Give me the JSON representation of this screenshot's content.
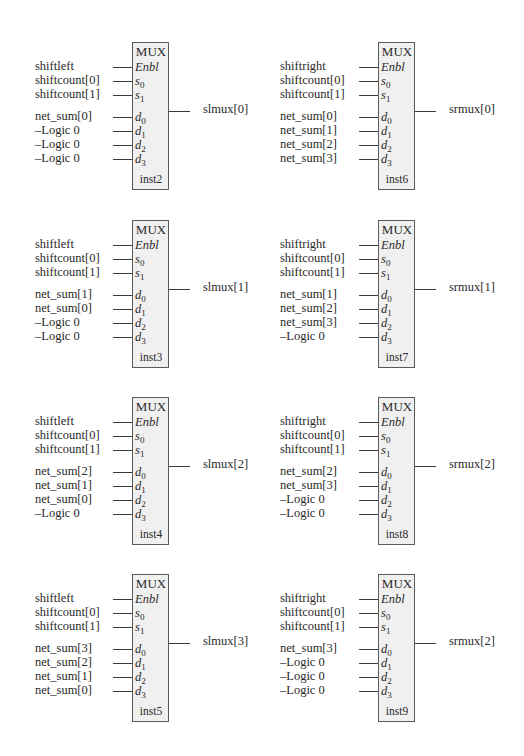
{
  "mux_title": "MUX",
  "pins": {
    "enable": "Enbl",
    "s": "s",
    "d": "d",
    "sel_subs": [
      "0",
      "1"
    ],
    "data_subs": [
      "0",
      "1",
      "2",
      "3"
    ]
  },
  "colors": {
    "box_fill": "#f0f0f0",
    "box_border": "#5a5a5a",
    "wire": "#3a3a3a",
    "text": "#2a2a2a"
  },
  "blocks": [
    {
      "instance": "inst2",
      "enable": "shiftleft",
      "sel": [
        "shiftcount[0]",
        "shiftcount[1]"
      ],
      "data": [
        "net_sum[0]",
        "–Logic 0",
        "–Logic 0",
        "–Logic 0"
      ],
      "output": "slmux[0]"
    },
    {
      "instance": "inst6",
      "enable": "shiftright",
      "sel": [
        "shiftcount[0]",
        "shiftcount[1]"
      ],
      "data": [
        "net_sum[0]",
        "net_sum[1]",
        "net_sum[2]",
        "net_sum[3]"
      ],
      "output": "srmux[0]"
    },
    {
      "instance": "inst3",
      "enable": "shiftleft",
      "sel": [
        "shiftcount[0]",
        "shiftcount[1]"
      ],
      "data": [
        "net_sum[1]",
        "net_sum[0]",
        "–Logic 0",
        "–Logic 0"
      ],
      "output": "slmux[1]"
    },
    {
      "instance": "inst7",
      "enable": "shiftright",
      "sel": [
        "shiftcount[0]",
        "shiftcount[1]"
      ],
      "data": [
        "net_sum[1]",
        "net_sum[2]",
        "net_sum[3]",
        "–Logic 0"
      ],
      "output": "srmux[1]"
    },
    {
      "instance": "inst4",
      "enable": "shiftleft",
      "sel": [
        "shiftcount[0]",
        "shiftcount[1]"
      ],
      "data": [
        "net_sum[2]",
        "net_sum[1]",
        "net_sum[0]",
        "–Logic 0"
      ],
      "output": "slmux[2]"
    },
    {
      "instance": "inst8",
      "enable": "shiftright",
      "sel": [
        "shiftcount[0]",
        "shiftcount[1]"
      ],
      "data": [
        "net_sum[2]",
        "net_sum[3]",
        "–Logic 0",
        "–Logic 0"
      ],
      "output": "srmux[2]"
    },
    {
      "instance": "inst5",
      "enable": "shiftleft",
      "sel": [
        "shiftcount[0]",
        "shiftcount[1]"
      ],
      "data": [
        "net_sum[3]",
        "net_sum[2]",
        "net_sum[1]",
        "net_sum[0]"
      ],
      "output": "slmux[3]"
    },
    {
      "instance": "inst9",
      "enable": "shiftright",
      "sel": [
        "shiftcount[0]",
        "shiftcount[1]"
      ],
      "data": [
        "net_sum[3]",
        "–Logic 0",
        "–Logic 0",
        "–Logic 0"
      ],
      "output": "srmux[2]"
    }
  ]
}
